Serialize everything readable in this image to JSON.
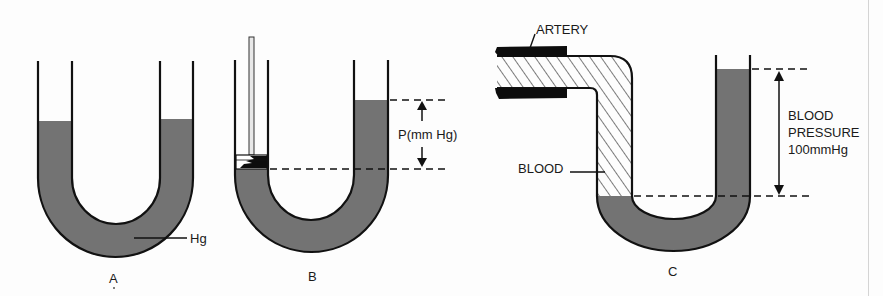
{
  "figure": {
    "colors": {
      "mercury": "#737373",
      "outline": "#111111",
      "background": "#fdfdfd",
      "hatch": "#222222",
      "artery": "#0d0d0d"
    },
    "panels": [
      {
        "id": "A",
        "caption": "A",
        "labels": {
          "mercury": "Hg"
        },
        "description": "U-tube manometer with mercury at equal level in both arms"
      },
      {
        "id": "B",
        "caption": "B",
        "labels": {
          "pressure": "P(mm Hg)"
        },
        "description": "Piston pushing on left arm raises mercury column in right arm by P mm Hg"
      },
      {
        "id": "C",
        "caption": "C",
        "labels": {
          "artery": "ARTERY",
          "blood": "BLOOD",
          "pressure_line1": "BLOOD",
          "pressure_line2": "PRESSURE",
          "pressure_line3": "100mmHg"
        },
        "description": "Artery connected to manometer; blood displaces mercury, difference equals blood pressure 100 mmHg"
      }
    ]
  }
}
